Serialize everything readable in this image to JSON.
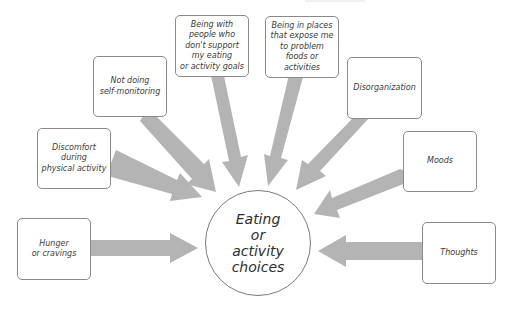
{
  "diagram": {
    "title": "",
    "center": {
      "label": "Eating\nor\nactivity\nchoices"
    },
    "factors": [
      {
        "label": "Hunger\nor cravings"
      },
      {
        "label": "Discomfort\nduring\nphysical activity"
      },
      {
        "label": "Not doing\nself-monitoring"
      },
      {
        "label": "Being with\npeople who\ndon't support\nmy eating\nor activity goals"
      },
      {
        "label": "Being in places\nthat expose me\nto problem\nfoods or\nactivities"
      },
      {
        "label": "Disorganization"
      },
      {
        "label": "Moods"
      },
      {
        "label": "Thoughts"
      }
    ],
    "colors": {
      "arrow": "#b4b4b4",
      "box_border": "#8a8a8a",
      "text": "#3a3a3a",
      "background": "#ffffff"
    }
  }
}
